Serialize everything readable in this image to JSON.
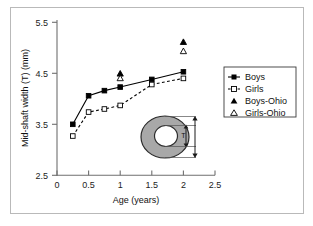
{
  "chart_data": {
    "type": "line",
    "title": "",
    "xlabel": "Age (years)",
    "ylabel": "Mid-shaft width (T) (mm)",
    "xlim": [
      0,
      2.5
    ],
    "ylim": [
      2.5,
      5.5
    ],
    "xticks": [
      "0",
      "0.5",
      "1",
      "1.5",
      "2",
      "2.5"
    ],
    "xtick_values": [
      0,
      0.5,
      1,
      1.5,
      2,
      2.5
    ],
    "yticks": [
      "2.5",
      "3.5",
      "4.5",
      "5.5"
    ],
    "ytick_values": [
      2.5,
      3.5,
      4.5,
      5.5
    ],
    "grid": false,
    "legend_position": "right",
    "series": [
      {
        "name": "Boys",
        "marker": "filled-square",
        "line": "solid",
        "color": "#000000",
        "x": [
          0.25,
          0.5,
          0.75,
          1.0,
          1.5,
          2.0
        ],
        "values": [
          3.5,
          4.06,
          4.16,
          4.23,
          4.38,
          4.53
        ]
      },
      {
        "name": "Girls",
        "marker": "open-square",
        "line": "dashed",
        "color": "#000000",
        "x": [
          0.25,
          0.5,
          0.75,
          1.0,
          1.5,
          2.0
        ],
        "values": [
          3.27,
          3.74,
          3.8,
          3.87,
          4.28,
          4.4
        ]
      },
      {
        "name": "Boys-Ohio",
        "marker": "filled-triangle",
        "line": "none",
        "color": "#000000",
        "x": [
          1.0,
          2.0
        ],
        "values": [
          4.5,
          5.12
        ]
      },
      {
        "name": "Girls-Ohio",
        "marker": "open-triangle",
        "line": "none",
        "color": "#000000",
        "x": [
          1.0,
          2.0
        ],
        "values": [
          4.41,
          4.94
        ]
      }
    ]
  },
  "legend": {
    "items": [
      {
        "label": "Boys"
      },
      {
        "label": "Girls"
      },
      {
        "label": "Boys-Ohio"
      },
      {
        "label": "Girls-Ohio"
      }
    ]
  },
  "inset": {
    "name": "bone-cross-section",
    "dimension_label": "T",
    "fill_color": "#a8a8a8",
    "stroke_color": "#2b2b2b"
  },
  "axes": {
    "x_title": "Age (years)",
    "y_title": "Mid-shaft width (T) (mm)",
    "x_tick_labels": [
      "0",
      "0.5",
      "1",
      "1.5",
      "2",
      "2.5"
    ],
    "y_tick_labels": [
      "5.5",
      "4.5",
      "3.5",
      "2.5"
    ]
  }
}
